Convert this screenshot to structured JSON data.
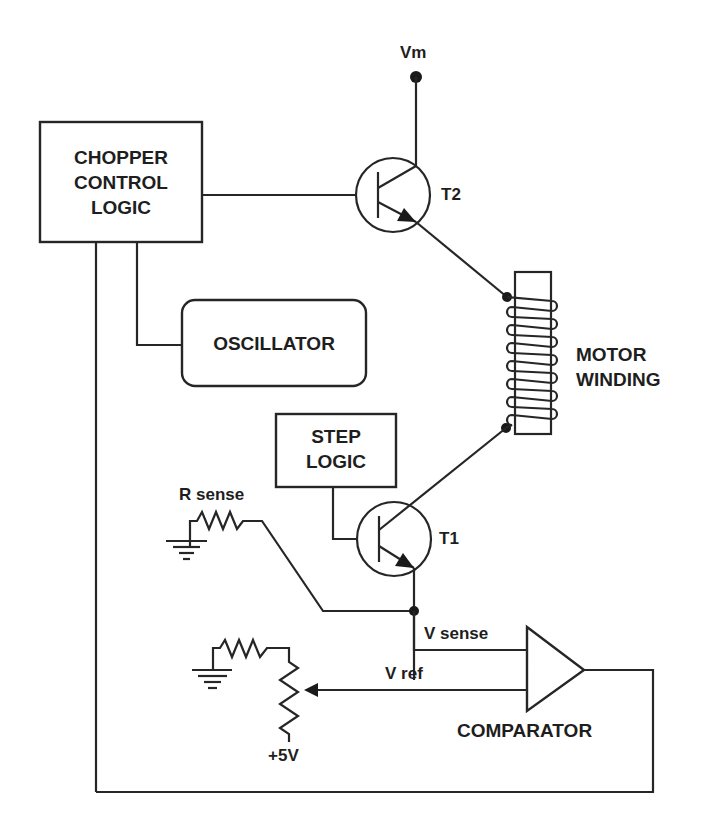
{
  "diagram": {
    "colors": {
      "line": "#262626",
      "text": "#1e1e1e",
      "background": "#ffffff"
    },
    "blocks": {
      "chopper_control_logic": {
        "line1": "CHOPPER",
        "line2": "CONTROL",
        "line3": "LOGIC"
      },
      "oscillator": {
        "label": "OSCILLATOR"
      },
      "step_logic": {
        "line1": "STEP",
        "line2": "LOGIC"
      },
      "comparator": {
        "label": "COMPARATOR"
      },
      "motor_winding": {
        "line1": "MOTOR",
        "line2": "WINDING"
      }
    },
    "components": {
      "supply": {
        "label": "Vm"
      },
      "transistor_t2": {
        "label": "T2"
      },
      "transistor_t1": {
        "label": "T1"
      },
      "r_sense": {
        "label": "R sense"
      },
      "ref_supply": {
        "label": "+5V"
      }
    },
    "signals": {
      "v_sense": {
        "label": "V sense"
      },
      "v_ref": {
        "label": "V ref"
      }
    }
  }
}
